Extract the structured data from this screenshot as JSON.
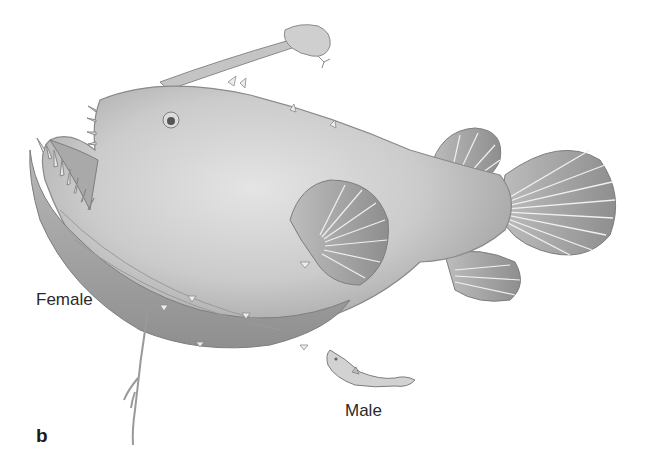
{
  "figure": {
    "panel_letter": "b",
    "labels": {
      "female": "Female",
      "male": "Male"
    },
    "colors": {
      "body": "#c9c9c9",
      "body_light": "#e2e2e2",
      "body_shadow": "#9a9a9a",
      "outline": "#7d7d7d",
      "fin_ray": "#f0f0f0",
      "text": "#2a2a2a"
    }
  }
}
